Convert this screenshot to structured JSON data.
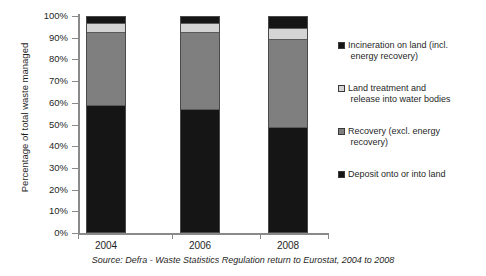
{
  "chart_data": {
    "type": "bar",
    "stacked": true,
    "title": "",
    "subtitle": "",
    "xlabel": "",
    "ylabel": "Percentage of total waste managed",
    "categories": [
      "2004",
      "2006",
      "2008"
    ],
    "ylim": [
      0,
      100
    ],
    "ytick_labels": [
      "100%",
      "90%",
      "80%",
      "70%",
      "60%",
      "50%",
      "40%",
      "30%",
      "20%",
      "10%",
      "0%"
    ],
    "ytick_values": [
      100,
      90,
      80,
      70,
      60,
      50,
      40,
      30,
      20,
      10,
      0
    ],
    "grid": false,
    "legend_position": "right",
    "series": [
      {
        "name": "Deposit onto or into land",
        "color": "#151515",
        "values": [
          59,
          57,
          49
        ]
      },
      {
        "name": "Recovery (excl. energy recovery)",
        "color": "#7f7f7f",
        "values": [
          34,
          36,
          41
        ]
      },
      {
        "name": "Land treatment and release into water bodies",
        "color": "#d4d4d4",
        "values": [
          4,
          4,
          5
        ]
      },
      {
        "name": "Incineration on land (incl. energy recovery)",
        "color": "#151515",
        "values": [
          3,
          3,
          5
        ]
      }
    ],
    "annotations": [
      "Source: Defra - Waste Statistics Regulation return to Eurostat, 2004 to 2008"
    ]
  },
  "axes": {
    "y_title": "Percentage of total waste managed",
    "y_ticks": [
      "100%",
      "90%",
      "80%",
      "70%",
      "60%",
      "50%",
      "40%",
      "30%",
      "20%",
      "10%",
      "0%"
    ],
    "x_ticks": [
      "2004",
      "2006",
      "2008"
    ]
  },
  "legend": {
    "items": [
      {
        "label": "Incineration on land (incl. energy recovery)",
        "line1": "Incineration on land (incl.",
        "line2": "energy recovery)",
        "color": "#151515"
      },
      {
        "label": "Land treatment and release into water bodies",
        "line1": "Land treatment and",
        "line2": "release into water bodies",
        "color": "#d4d4d4"
      },
      {
        "label": "Recovery (excl. energy recovery)",
        "line1": "Recovery (excl. energy",
        "line2": "recovery)",
        "color": "#7f7f7f"
      },
      {
        "label": "Deposit onto or into land",
        "line1": "Deposit onto or into land",
        "line2": "",
        "color": "#151515"
      }
    ]
  },
  "footer": {
    "source": "Source: Defra - Waste Statistics Regulation return to Eurostat, 2004 to 2008"
  }
}
